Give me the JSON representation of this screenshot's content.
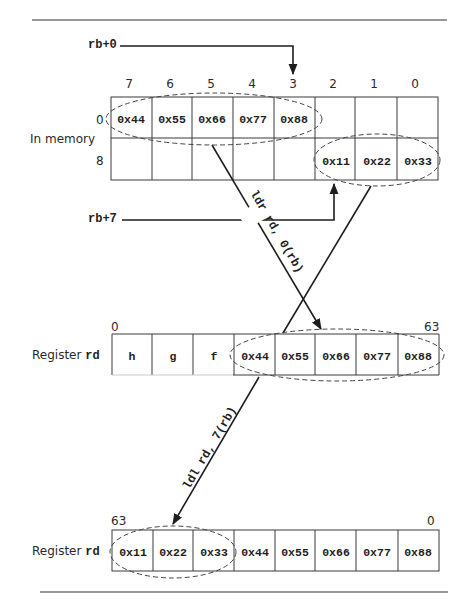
{
  "memory": {
    "label": "In memory",
    "column_indices": [
      "7",
      "6",
      "5",
      "4",
      "3",
      "2",
      "1",
      "0"
    ],
    "row_labels": [
      "0",
      "8"
    ],
    "rows": [
      [
        "0x44",
        "0x55",
        "0x66",
        "0x77",
        "0x88",
        "",
        "",
        ""
      ],
      [
        "",
        "",
        "",
        "",
        "",
        "0x11",
        "0x22",
        "0x33"
      ]
    ]
  },
  "pointers": {
    "rb0": "rb+0",
    "rb7": "rb+7"
  },
  "instructions": {
    "ldr": "ldr rd, 0(rb)",
    "ldl": "ldl rd, 7(rb)"
  },
  "register1": {
    "label_prefix": "Register ",
    "label_reg": "rd",
    "left_index": "0",
    "right_index": "63",
    "cells": [
      "h",
      "g",
      "f",
      "0x44",
      "0x55",
      "0x66",
      "0x77",
      "0x88"
    ]
  },
  "register2": {
    "label_prefix": "Register ",
    "label_reg": "rd",
    "left_index": "63",
    "right_index": "0",
    "cells": [
      "0x11",
      "0x22",
      "0x33",
      "0x44",
      "0x55",
      "0x66",
      "0x77",
      "0x88"
    ]
  },
  "colors": {
    "line": "#1e1e1e",
    "grid": "#3a3a3a",
    "dash": "#444444"
  }
}
